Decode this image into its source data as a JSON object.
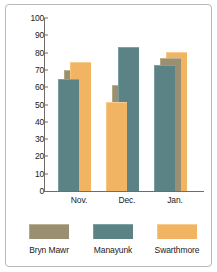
{
  "chart_data": {
    "type": "bar",
    "title": "",
    "subtitle": "",
    "xlabel": "",
    "ylabel": "",
    "categories": [
      "Nov.",
      "Dec.",
      "Jan."
    ],
    "ylim": [
      0,
      100
    ],
    "yticks": [
      0,
      10,
      20,
      30,
      40,
      50,
      60,
      70,
      80,
      90,
      100
    ],
    "ytick_labels": [
      "0",
      "10",
      "20",
      "30",
      "40",
      "50",
      "60",
      "70",
      "80",
      "90",
      "100"
    ],
    "grid": false,
    "legend_position": "bottom",
    "series": [
      {
        "name": "Bryn Mawr",
        "color": "#9a8f70",
        "values": [
          70,
          61,
          77
        ]
      },
      {
        "name": "Manayunk",
        "color": "#5b8386",
        "values": [
          65,
          83.5,
          73
        ]
      },
      {
        "name": "Swarthmore",
        "color": "#f0b462",
        "values": [
          74.5,
          51.5,
          80.5
        ]
      }
    ]
  },
  "axis": {
    "ticks": [
      {
        "label": "100"
      },
      {
        "label": "90"
      },
      {
        "label": "80"
      },
      {
        "label": "70"
      },
      {
        "label": "60"
      },
      {
        "label": "50"
      },
      {
        "label": "40"
      },
      {
        "label": "30"
      },
      {
        "label": "20"
      },
      {
        "label": "10"
      },
      {
        "label": "0"
      }
    ]
  },
  "groups": [
    {
      "label": "Nov."
    },
    {
      "label": "Dec."
    },
    {
      "label": "Jan."
    }
  ],
  "legend": {
    "items": [
      {
        "label": "Bryn Mawr"
      },
      {
        "label": "Manayunk"
      },
      {
        "label": "Swarthmore"
      }
    ]
  }
}
